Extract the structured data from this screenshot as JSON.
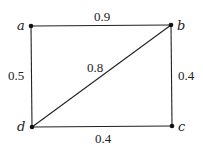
{
  "diagram": {
    "type": "weighted-graph",
    "nodes": [
      {
        "id": "a",
        "label": "a",
        "x": 31,
        "y": 26
      },
      {
        "id": "b",
        "label": "b",
        "x": 171,
        "y": 25
      },
      {
        "id": "c",
        "label": "c",
        "x": 172,
        "y": 126
      },
      {
        "id": "d",
        "label": "d",
        "x": 32,
        "y": 127
      }
    ],
    "edges": [
      {
        "from": "a",
        "to": "b",
        "weight": "0.9"
      },
      {
        "from": "a",
        "to": "d",
        "weight": "0.5"
      },
      {
        "from": "d",
        "to": "b",
        "weight": "0.8"
      },
      {
        "from": "b",
        "to": "c",
        "weight": "0.4"
      },
      {
        "from": "d",
        "to": "c",
        "weight": "0.4"
      }
    ]
  }
}
